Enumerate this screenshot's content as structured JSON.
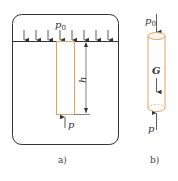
{
  "figure": {
    "panel_a": {
      "caption": "a)",
      "surface_pressure_label": "p",
      "surface_pressure_subscript": "0",
      "height_label": "h",
      "bottom_pressure_label": "p"
    },
    "panel_b": {
      "caption": "b)",
      "top_pressure_label": "p",
      "top_pressure_subscript": "0",
      "weight_label": "G",
      "bottom_pressure_label": "p"
    },
    "colors": {
      "outline": "#333333",
      "tube": "#e8a060"
    }
  }
}
